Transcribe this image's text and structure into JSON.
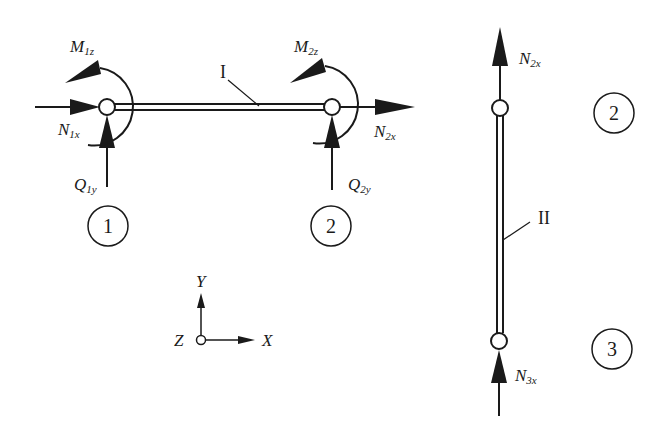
{
  "diagram": {
    "colors": {
      "stroke": "#1a1a1a",
      "background": "#ffffff"
    },
    "element_I": {
      "label": "I",
      "nodes": [
        "1",
        "2"
      ],
      "forces": {
        "M1": {
          "main": "M",
          "sub": "1z"
        },
        "N1": {
          "main": "N",
          "sub": "1x"
        },
        "Q1": {
          "main": "Q",
          "sub": "1y"
        },
        "M2": {
          "main": "M",
          "sub": "2z"
        },
        "N2": {
          "main": "N",
          "sub": "2x"
        },
        "Q2": {
          "main": "Q",
          "sub": "2y"
        }
      }
    },
    "element_II": {
      "label": "II",
      "nodes": [
        "2",
        "3"
      ],
      "forces": {
        "N2": {
          "main": "N",
          "sub": "2x"
        },
        "N3": {
          "main": "N",
          "sub": "3x"
        }
      }
    },
    "axes": {
      "x": "X",
      "y": "Y",
      "z": "Z"
    }
  }
}
